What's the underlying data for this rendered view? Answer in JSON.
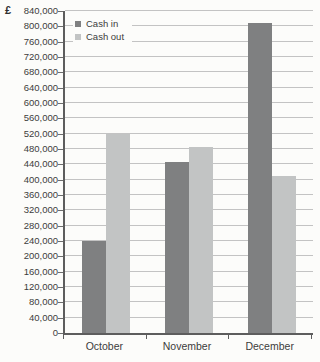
{
  "currency_label": "£",
  "chart_data": {
    "type": "bar",
    "title": "",
    "categories": [
      "October",
      "November",
      "December"
    ],
    "series": [
      {
        "name": "Cash in",
        "color": "#7f8081",
        "values": [
          240000,
          445000,
          810000
        ]
      },
      {
        "name": "Cash out",
        "color": "#c2c4c4",
        "values": [
          520000,
          485000,
          410000
        ]
      }
    ],
    "ylabel": "£",
    "xlabel": "",
    "ylim": [
      0,
      840000
    ],
    "ytick_step": 40000,
    "grid": true,
    "legend_position": "top-left"
  }
}
